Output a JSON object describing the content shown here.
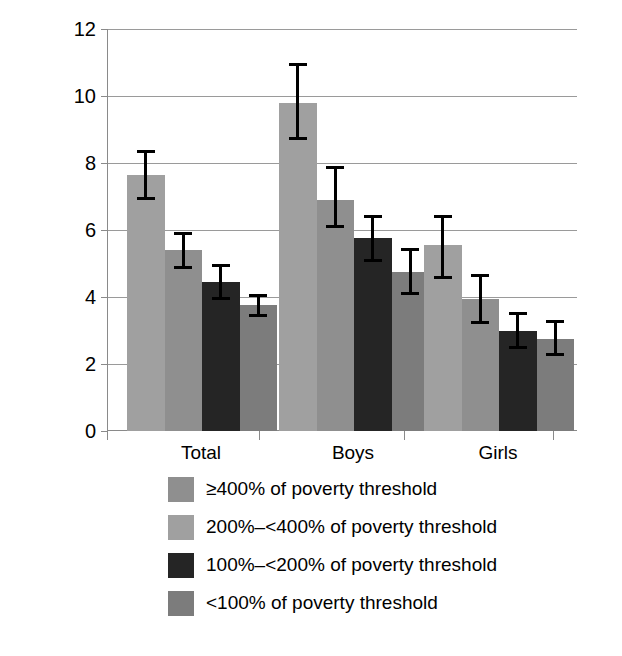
{
  "chart_data": {
    "type": "bar",
    "title": "",
    "xlabel": "",
    "ylabel": "Percentage",
    "ylim": [
      0,
      12
    ],
    "yticks": [
      0,
      2,
      4,
      6,
      8,
      10,
      12
    ],
    "ytick_labels": [
      "0",
      "2",
      "4",
      "6",
      "8",
      "10",
      "12"
    ],
    "grid": true,
    "legend_position": "bottom",
    "categories": [
      "Total",
      "Boys",
      "Girls"
    ],
    "series": [
      {
        "name": "≥400% of poverty threshold",
        "color": "#a0a0a0",
        "values": [
          7.65,
          9.8,
          5.55
        ],
        "error_low": [
          6.9,
          8.7,
          4.55
        ],
        "error_high": [
          8.4,
          11.0,
          6.45
        ]
      },
      {
        "name": "200%–<400% of poverty threshold",
        "color": "#8f8f8f",
        "values": [
          5.4,
          6.9,
          3.95
        ],
        "error_low": [
          4.85,
          6.05,
          3.2
        ],
        "error_high": [
          5.95,
          7.9,
          4.7
        ]
      },
      {
        "name": "100%–<200% of poverty threshold",
        "color": "#252525",
        "values": [
          4.45,
          5.75,
          3.0
        ],
        "error_low": [
          3.9,
          5.05,
          2.45
        ],
        "error_high": [
          5.0,
          6.45,
          3.55
        ]
      },
      {
        "name": "<100% of poverty threshold",
        "color": "#7c7c7c",
        "values": [
          3.75,
          4.75,
          2.75
        ],
        "error_low": [
          3.4,
          4.05,
          2.25
        ],
        "error_high": [
          4.1,
          5.45,
          3.3
        ]
      }
    ]
  },
  "legend": {
    "items": [
      {
        "label": "≥400% of poverty threshold",
        "color": "#8f8f8f"
      },
      {
        "label": "200%–<400% of poverty threshold",
        "color": "#a0a0a0"
      },
      {
        "label": "100%–<200% of poverty threshold",
        "color": "#252525"
      },
      {
        "label": "<100% of poverty threshold",
        "color": "#7c7c7c"
      }
    ]
  },
  "axis": {
    "y_title": "Percentage"
  }
}
